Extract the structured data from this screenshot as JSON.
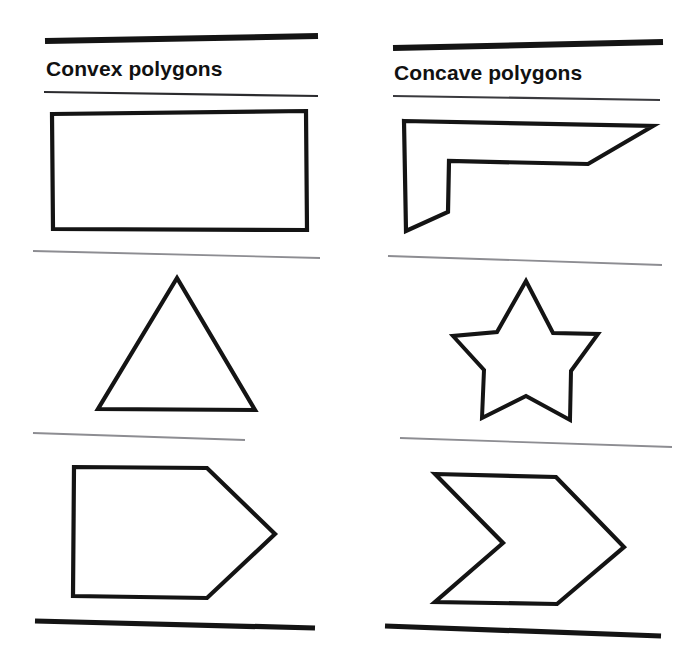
{
  "page": {
    "background_color": "#ffffff",
    "ink_color": "#141414",
    "rule_gray": "#8d8d92",
    "width": 698,
    "height": 668
  },
  "columns": [
    {
      "id": "convex",
      "heading": "Convex polygons",
      "shapes": [
        {
          "name": "rectangle",
          "label": "rectangle",
          "vertices": 4
        },
        {
          "name": "triangle",
          "label": "triangle",
          "vertices": 3
        },
        {
          "name": "pentagon-arrowhead",
          "label": "pentagon",
          "vertices": 5
        }
      ]
    },
    {
      "id": "concave",
      "heading": "Concave polygons",
      "shapes": [
        {
          "name": "l-shaped-hexagon",
          "label": "L-shaped hexagon",
          "vertices": 6
        },
        {
          "name": "five-point-star",
          "label": "five-pointed star",
          "vertices": 10
        },
        {
          "name": "chevron",
          "label": "chevron",
          "vertices": 6
        }
      ]
    }
  ],
  "rules": {
    "top_left": {
      "x1": 45,
      "y1": 41,
      "x2": 318,
      "y2": 36,
      "weight": 6,
      "color": "#141414"
    },
    "top_right": {
      "x1": 393,
      "y1": 48,
      "x2": 663,
      "y2": 42,
      "weight": 6,
      "color": "#141414"
    },
    "head_left": {
      "x1": 44,
      "y1": 92,
      "x2": 318,
      "y2": 96,
      "weight": 2,
      "color": "#2b2b2e"
    },
    "head_right": {
      "x1": 393,
      "y1": 96,
      "x2": 660,
      "y2": 100,
      "weight": 2,
      "color": "#3a3a3e"
    },
    "mid1_left": {
      "x1": 33,
      "y1": 251,
      "x2": 320,
      "y2": 258,
      "weight": 1.6,
      "color": "#8d8d92"
    },
    "mid1_right": {
      "x1": 388,
      "y1": 256,
      "x2": 662,
      "y2": 265,
      "weight": 1.6,
      "color": "#8d8d92"
    },
    "mid2_left": {
      "x1": 33,
      "y1": 433,
      "x2": 245,
      "y2": 440,
      "weight": 1.6,
      "color": "#8d8d92"
    },
    "mid2_right": {
      "x1": 400,
      "y1": 438,
      "x2": 672,
      "y2": 447,
      "weight": 1.6,
      "color": "#8d8d92"
    },
    "bottom_left": {
      "x1": 35,
      "y1": 621,
      "x2": 315,
      "y2": 628,
      "weight": 5,
      "color": "#141414"
    },
    "bottom_right": {
      "x1": 385,
      "y1": 626,
      "x2": 661,
      "y2": 636,
      "weight": 5,
      "color": "#141414"
    }
  },
  "shape_geometry": {
    "rectangle": "52,114 306,111 307,230 53,229",
    "triangle": "177,278 255,410 98,409",
    "pentagon_arrowhead": "74,467 207,468 275,534 207,598 73,596",
    "l_hexagon": "404,121 653,126 588,164 449,161 448,212 406,231",
    "star": "526,281 553,333 598,334 571,371 570,420 526,396 482,418 484,370 453,336 497,332",
    "chevron": "435,474 556,477 624,547 557,604 435,602 503,543"
  }
}
